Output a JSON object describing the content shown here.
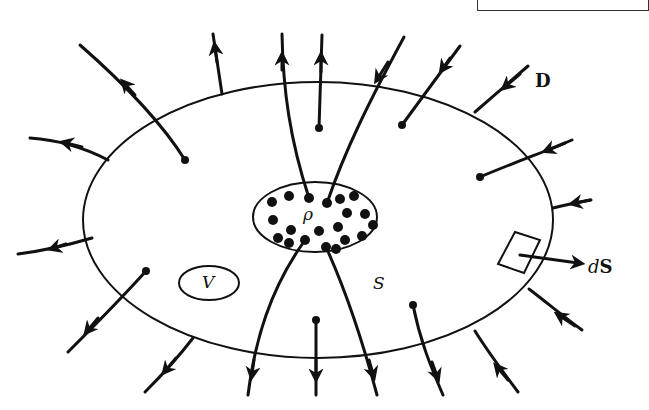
{
  "figure": {
    "labels": {
      "field": "D",
      "charge_density": "ρ",
      "volume": "V",
      "surface": "S",
      "area_element_d": "d",
      "area_element_S": "S"
    },
    "colors": {
      "ink": "#111111",
      "background": "#ffffff"
    },
    "charge_region_dot_count": 20,
    "outer_surface": {
      "shape": "ellipse",
      "cx": 318,
      "cy": 220,
      "rx": 235,
      "ry": 138
    },
    "charge_region": {
      "shape": "ellipse",
      "cx": 315,
      "cy": 217,
      "rx": 62,
      "ry": 35
    },
    "volume_region": {
      "shape": "ellipse",
      "cx": 209,
      "cy": 283,
      "rx": 30,
      "ry": 17
    }
  }
}
